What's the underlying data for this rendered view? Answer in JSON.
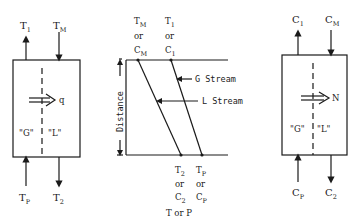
{
  "diagram": {
    "left_block": {
      "top_left_label": {
        "main": "T",
        "sub": "1"
      },
      "top_right_label": {
        "main": "T",
        "sub": "M"
      },
      "bottom_left_label": {
        "main": "T",
        "sub": "P"
      },
      "bottom_right_label": {
        "main": "T",
        "sub": "2"
      },
      "flux_label": "q",
      "phase_g": "\"G\"",
      "phase_l": "\"L\""
    },
    "middle_chart": {
      "y_axis_label": "Distance",
      "x_axis_label": "T or P",
      "top_labels": [
        {
          "line1": {
            "main": "T",
            "sub": "M"
          },
          "line2": "or",
          "line3": {
            "main": "C",
            "sub": "M"
          }
        },
        {
          "line1": {
            "main": "T",
            "sub": "1"
          },
          "line2": "or",
          "line3": {
            "main": "C",
            "sub": "1"
          }
        }
      ],
      "bottom_labels": [
        {
          "line1": {
            "main": "T",
            "sub": "2"
          },
          "line2": "or",
          "line3": {
            "main": "C",
            "sub": "2"
          }
        },
        {
          "line1": {
            "main": "T",
            "sub": "P"
          },
          "line2": "or",
          "line3": {
            "main": "C",
            "sub": "P"
          }
        }
      ],
      "g_stream_label": "G Stream",
      "l_stream_label": "L Stream"
    },
    "right_block": {
      "top_left_label": {
        "main": "C",
        "sub": "1"
      },
      "top_right_label": {
        "main": "C",
        "sub": "M"
      },
      "bottom_left_label": {
        "main": "C",
        "sub": "P"
      },
      "bottom_right_label": {
        "main": "C",
        "sub": "2"
      },
      "flux_label": "N",
      "phase_g": "\"G\"",
      "phase_l": "\"L\""
    }
  }
}
